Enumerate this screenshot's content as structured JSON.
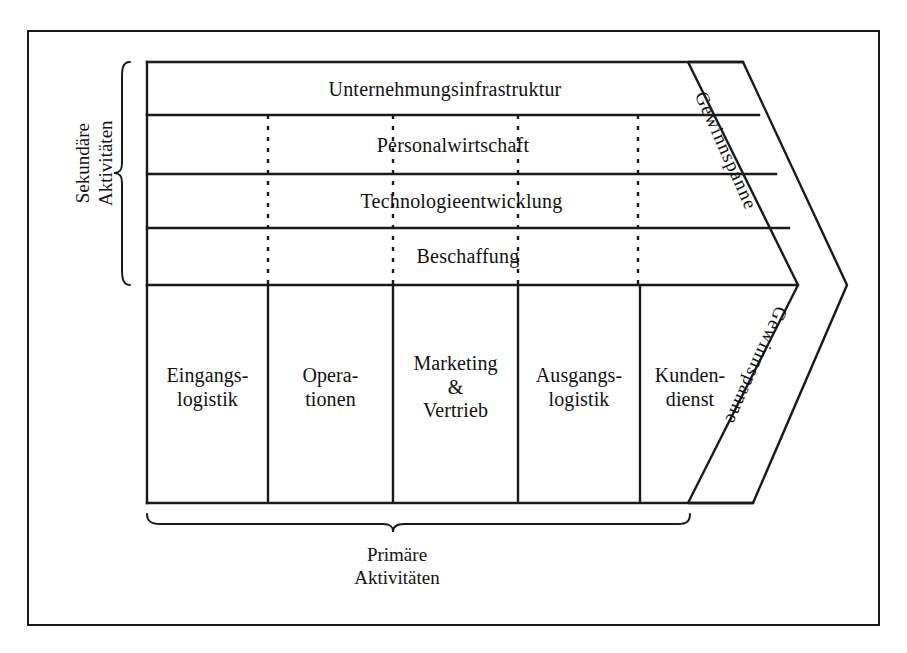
{
  "diagram": {
    "type": "value-chain",
    "support_bracket": "Sekundäre\nAktivitäten",
    "primary_bracket": "Primäre\nAktivitäten",
    "support_activities": [
      {
        "label": "Unternehmungsinfrastruktur",
        "spans_full_width": true
      },
      {
        "label": "Personalwirtschaft",
        "spans_full_width": false
      },
      {
        "label": "Technologieentwicklung",
        "spans_full_width": false
      },
      {
        "label": "Beschaffung",
        "spans_full_width": false
      }
    ],
    "primary_activities": [
      {
        "label": "Eingangs-\nlogistik"
      },
      {
        "label": "Opera-\ntionen"
      },
      {
        "label": "Marketing\n&\nVertrieb"
      },
      {
        "label": "Ausgangs-\nlogistik"
      },
      {
        "label": "Kunden-\ndienst"
      }
    ],
    "margin_upper": "Gewinnspanne",
    "margin_lower": "Gewinnspanne",
    "colors": {
      "line": "#1a1a1a",
      "background": "#ffffff",
      "text": "#111111"
    }
  }
}
